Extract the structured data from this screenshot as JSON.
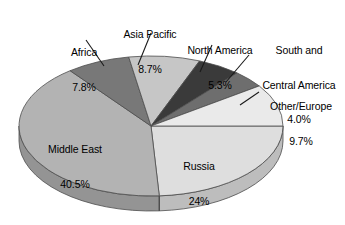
{
  "chart_data": {
    "type": "pie",
    "title": "",
    "subtitle": "",
    "xlabel": "",
    "ylabel": "",
    "legend_position": "none",
    "grid": false,
    "style": "3d-exploded-none",
    "unit": "%",
    "categories": [
      "Russia",
      "Middle East",
      "Africa",
      "Asia Pacific",
      "North America",
      "South and Central America",
      "Other/Europe"
    ],
    "values": [
      24.0,
      40.5,
      7.8,
      8.7,
      5.3,
      4.0,
      9.7
    ],
    "slices": [
      {
        "name": "Russia",
        "label": "Russia",
        "value": 24.0,
        "value_text": "24%",
        "color": "#dedede",
        "side_color": "#bdbdbd",
        "label_placement": "inside",
        "start_angle": 0,
        "end_angle": 86.4
      },
      {
        "name": "Middle East",
        "label": "Middle East",
        "value": 40.5,
        "value_text": "40.5%",
        "color": "#b3b3b3",
        "side_color": "#949494",
        "label_placement": "inside",
        "start_angle": 86.4,
        "end_angle": 232.2
      },
      {
        "name": "Africa",
        "label": "Africa",
        "value": 7.8,
        "value_text": "7.8%",
        "color": "#787878",
        "side_color": "#5e5e5e",
        "label_placement": "callout",
        "start_angle": 232.2,
        "end_angle": 260.28
      },
      {
        "name": "Asia Pacific",
        "label": "Asia Pacific",
        "value": 8.7,
        "value_text": "8.7%",
        "color": "#c6c6c6",
        "side_color": "#a6a6a6",
        "label_placement": "callout",
        "start_angle": 260.28,
        "end_angle": 291.6
      },
      {
        "name": "North America",
        "label": "North America",
        "value": 5.3,
        "value_text": "5.3%",
        "color": "#3a3a3a",
        "side_color": "#262626",
        "label_placement": "callout",
        "start_angle": 291.6,
        "end_angle": 310.68
      },
      {
        "name": "South and Central America",
        "label": "South and\nCentral America",
        "value": 4.0,
        "value_text": "4.0%",
        "color": "#6e6e6e",
        "side_color": "#555555",
        "label_placement": "callout",
        "start_angle": 310.68,
        "end_angle": 325.08
      },
      {
        "name": "Other/Europe",
        "label": "Other/Europe",
        "value": 9.7,
        "value_text": "9.7%",
        "color": "#eaeaea",
        "side_color": "#cacaca",
        "label_placement": "callout",
        "start_angle": 325.08,
        "end_angle": 360
      }
    ]
  },
  "labels": {
    "africa": {
      "name": "Africa",
      "value": "7.8%"
    },
    "asia_pacific": {
      "name": "Asia Pacific",
      "value": "8.7%"
    },
    "north_america": {
      "name": "North America",
      "value": "5.3%"
    },
    "south_central_america": {
      "name_line1": "South and",
      "name_line2": "Central America",
      "value": "4.0%"
    },
    "other_europe": {
      "name": "Other/Europe",
      "value": "9.7%"
    },
    "middle_east": {
      "name": "Middle East",
      "value": "40.5%"
    },
    "russia": {
      "name": "Russia",
      "value": "24%"
    }
  },
  "colors": {
    "background": "#ffffff",
    "text": "#000000",
    "outline": "#4d4d4d",
    "leader_line": "#1a1a1a"
  }
}
